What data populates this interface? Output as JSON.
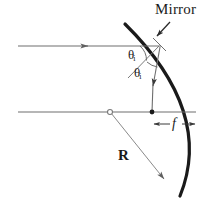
{
  "figure": {
    "labels": {
      "mirror": "Mirror",
      "radius": "R",
      "focal_length": "f",
      "angle_incidence": "θ",
      "angle_incidence_sub": "i",
      "angle_reflection": "θ",
      "angle_reflection_sub": "i"
    },
    "colors": {
      "mirror_stroke": "#1a1a1a",
      "ray_stroke": "#6e6e6e",
      "axis_stroke": "#6e6e6e",
      "label_text": "#1a1a1a",
      "background": "#ffffff"
    },
    "geometry": {
      "center_of_curvature": [
        110,
        112
      ],
      "focal_point": [
        152,
        112
      ],
      "reflection_point": [
        159,
        46
      ],
      "mirror_vertex": [
        196,
        112
      ],
      "radius_px": 86,
      "focal_length_px": 44,
      "incoming_ray_y": 46,
      "optical_axis_y": 112,
      "arc_top": [
        125,
        24
      ],
      "arc_bottom": [
        180,
        196
      ]
    }
  }
}
